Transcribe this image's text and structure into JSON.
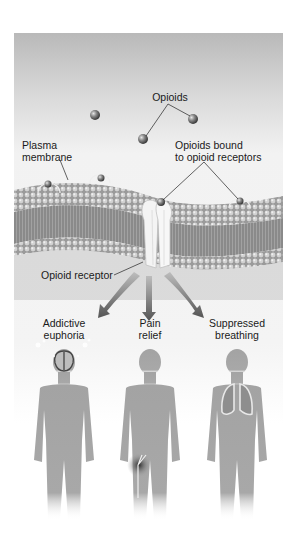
{
  "figure": {
    "labels": {
      "opioids": "Opioids",
      "plasma_membrane_line1": "Plasma",
      "plasma_membrane_line2": "membrane",
      "bound_line1": "Opioids bound",
      "bound_line2": "to opioid receptors",
      "receptor": "Opioid receptor"
    },
    "effects": [
      {
        "line1": "Addictive",
        "line2": "euphoria",
        "organ": "brain"
      },
      {
        "line1": "Pain",
        "line2": "relief",
        "organ": "nerve-in-leg"
      },
      {
        "line1": "Suppressed",
        "line2": "breathing",
        "organ": "lungs"
      }
    ],
    "colors": {
      "background_top": "#b9b9b9",
      "membrane": "#8e8e8e",
      "receptor": "#f4f4f4",
      "arrow": "#6e6e6e",
      "body": "#a3a3a3"
    }
  }
}
